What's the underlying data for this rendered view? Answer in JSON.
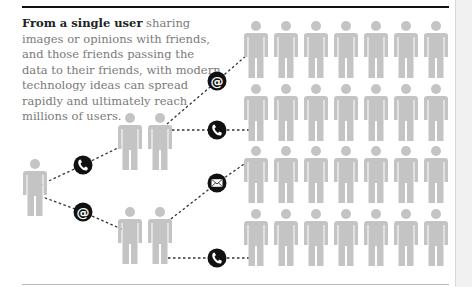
{
  "caption": {
    "lead": "From a single user",
    "body": " sharing images or opinions with friends, and those friends passing the data to their friends, with modern technology ideas can spread rapidly and ultimately reach millions of users."
  },
  "colors": {
    "figure": "#c4c4c4",
    "icon_bg": "#111111",
    "rule_top": "#111111",
    "rule_bottom": "#bbbbbb",
    "dash": "#333333"
  },
  "diagram": {
    "source_user": {
      "x": 23,
      "y": 158
    },
    "friend_groups": [
      {
        "x": [
          118,
          148
        ],
        "y": 112
      },
      {
        "x": [
          118,
          148
        ],
        "y": 206
      }
    ],
    "crowd": {
      "columns": [
        244,
        274,
        304,
        334,
        364,
        394,
        424
      ],
      "rows": [
        20,
        83,
        145,
        208
      ]
    },
    "channel_icons": [
      {
        "type": "phone",
        "x": 83,
        "y": 165
      },
      {
        "type": "email-at",
        "x": 83,
        "y": 212
      },
      {
        "type": "email-at",
        "x": 217,
        "y": 81
      },
      {
        "type": "phone",
        "x": 217,
        "y": 130
      },
      {
        "type": "envelope",
        "x": 217,
        "y": 183
      },
      {
        "type": "phone",
        "x": 217,
        "y": 258
      }
    ]
  }
}
